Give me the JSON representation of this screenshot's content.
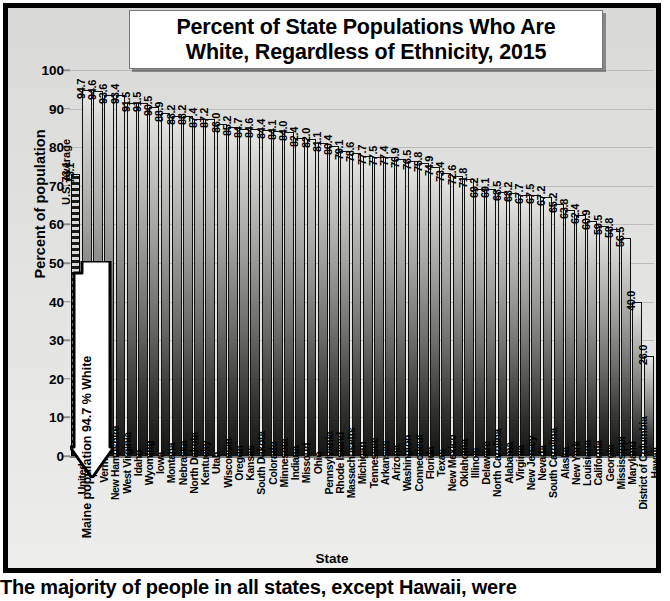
{
  "chart_data": {
    "type": "bar",
    "title_line1": "Percent of State Populations Who Are",
    "title_line2": "White, Regardless of Ethnicity, 2015",
    "xlabel": "State",
    "ylabel": "Percent of population",
    "ylim": [
      0,
      100
    ],
    "yticks": [
      0,
      10,
      20,
      30,
      40,
      50,
      60,
      70,
      80,
      90,
      100
    ],
    "grid": true,
    "legend": "none",
    "categories": [
      "United States",
      "Maine",
      "Vermont",
      "New Hampshire",
      "West Virginia",
      "Idaho",
      "Wyoming",
      "Iowa",
      "Montana",
      "Nebraska",
      "North Dakota",
      "Kentucky",
      "Utah",
      "Wisconsin",
      "Oregon",
      "Kansas",
      "South Dakota",
      "Colorado",
      "Minnesota",
      "Indiana",
      "Missouri",
      "Ohio",
      "Pennsylvania",
      "Rhode Island",
      "Massachusetts",
      "Michigan",
      "Tennessee",
      "Arkansas",
      "Arizona",
      "Washington",
      "Connecticut",
      "Florida",
      "Texas",
      "New Mexico",
      "Oklahoma",
      "Illinois",
      "Delaware",
      "North Carolina",
      "Alabama",
      "Virginia",
      "New Jersey",
      "Nevada",
      "South Carolina",
      "Alaska",
      "New York",
      "Louisiana",
      "California",
      "Georgia",
      "Mississippi",
      "Maryland",
      "District of Columbia",
      "Hawaii"
    ],
    "values": [
      73.1,
      94.7,
      94.6,
      93.6,
      93.4,
      91.5,
      91.5,
      90.5,
      88.9,
      88.2,
      88.2,
      87.4,
      87.2,
      86.0,
      85.2,
      84.7,
      84.6,
      84.4,
      84.1,
      84.0,
      82.4,
      82.0,
      81.1,
      80.4,
      79.1,
      78.6,
      77.7,
      77.5,
      77.4,
      76.9,
      76.5,
      75.8,
      74.9,
      73.4,
      72.6,
      71.8,
      69.2,
      69.1,
      68.5,
      68.2,
      67.7,
      67.5,
      67.2,
      65.2,
      63.8,
      62.4,
      60.9,
      59.5,
      58.8,
      56.5,
      40.0,
      26.0
    ],
    "value_labels": [
      "73.1",
      "94.7",
      "94.6",
      "93.6",
      "93.4",
      "91.5",
      "91.5",
      "90.5",
      "88.9",
      "88.2",
      "88.2",
      "87.4",
      "87.2",
      "86.0",
      "85.2",
      "84.7",
      "84.6",
      "84.4",
      "84.1",
      "84.0",
      "82.4",
      "82.0",
      "81.1",
      "80.4",
      "79.1",
      "78.6",
      "77.7",
      "77.5",
      "77.4",
      "76.9",
      "76.5",
      "75.8",
      "74.9",
      "73.4",
      "72.6",
      "71.8",
      "69.2",
      "69.1",
      "68.5",
      "68.2",
      "67.7",
      "67.5",
      "67.2",
      "65.2",
      "63.8",
      "62.4",
      "60.9",
      "59.5",
      "58.8",
      "56.5",
      "40.0",
      "26.0"
    ],
    "annotations": [
      {
        "name": "us-average",
        "text": "U.S. average",
        "value": "73.1"
      },
      {
        "name": "maine-callout",
        "text": "Maine population 94.7 % White"
      }
    ]
  },
  "caption": "The majority of people in all states, except Hawaii, were"
}
